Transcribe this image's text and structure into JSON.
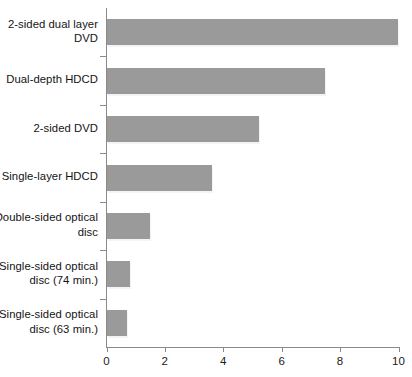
{
  "chart_data": {
    "type": "bar",
    "orientation": "horizontal",
    "title": "",
    "subtitle": "",
    "xlabel": "",
    "ylabel": "",
    "xlim": [
      0,
      10
    ],
    "ylim": null,
    "grid": false,
    "legend": null,
    "legend_position": "none",
    "xticks": [
      0,
      2,
      4,
      6,
      8,
      10
    ],
    "xtick_labels": [
      "0",
      "2",
      "4",
      "6",
      "8",
      "10"
    ],
    "categories": [
      "2-sided dual layer DVD",
      "Dual-depth HDCD",
      "2-sided DVD",
      "Single-layer HDCD",
      "Double-sided optical disc",
      "Single-sided optical disc (74 min.)",
      "Single-sided optical disc (63 min.)"
    ],
    "values": [
      9.95,
      7.45,
      5.2,
      3.6,
      1.48,
      0.8,
      0.7
    ],
    "bar_color": "#9a9a9a",
    "axis_color": "#8a8a8a",
    "text_color": "#141414",
    "background_color": "#ffffff"
  },
  "category_lines": [
    [
      "2-sided dual layer",
      "DVD"
    ],
    [
      "Dual-depth HDCD"
    ],
    [
      "2-sided DVD"
    ],
    [
      "Single-layer HDCD"
    ],
    [
      "Double-sided optical",
      "disc"
    ],
    [
      "Single-sided optical",
      "disc (74 min.)"
    ],
    [
      "Single-sided optical",
      "disc (63 min.)"
    ]
  ]
}
